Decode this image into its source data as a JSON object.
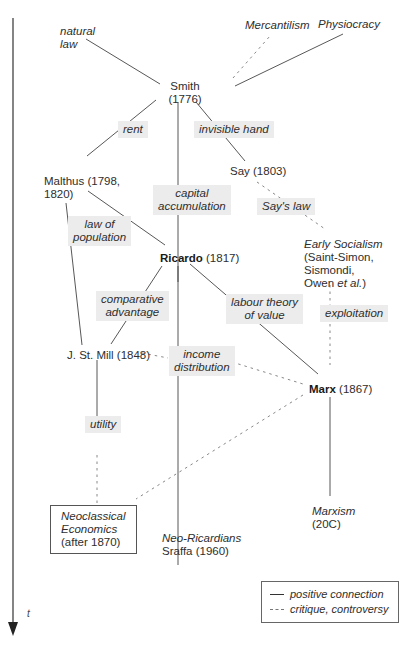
{
  "nodes": {
    "natural_law": {
      "line1": "natural",
      "line2": "law"
    },
    "mercantilism": "Mercantilism",
    "physiocracy": "Physiocracy",
    "smith": {
      "name": "Smith",
      "year": "(1776)"
    },
    "malthus": {
      "line1": "Malthus (1798,",
      "line2": "1820)"
    },
    "say": "Say (1803)",
    "ricardo": {
      "name": "Ricardo",
      "year": " (1817)"
    },
    "early_socialism": {
      "title": "Early Socialism",
      "line2": "(Saint-Simon,",
      "line3": "Sismondi,",
      "line4_pre": "Owen ",
      "line4_it": "et al.",
      "line4_post": ")"
    },
    "mill": "J. St. Mill (1848)",
    "marx": {
      "name": "Marx",
      "year": " (1867)"
    },
    "neoclassical": {
      "line1": "Neoclassical",
      "line2": "Economics",
      "line3": "(after 1870)"
    },
    "neo_ricardians": {
      "line1": "Neo-Ricardians",
      "line2": "Sraffa (1960)"
    },
    "marxism": {
      "line1": "Marxism",
      "line2": "(20C)"
    }
  },
  "edge_labels": {
    "rent": "rent",
    "invisible_hand": "invisible hand",
    "capital_accumulation": {
      "line1": "capital",
      "line2": "accumulation"
    },
    "says_law": "Say's law",
    "law_of_population": {
      "line1": "law of",
      "line2": "population"
    },
    "comparative_advantage": {
      "line1": "comparative",
      "line2": "advantage"
    },
    "labour_theory": {
      "line1": "labour theory",
      "line2": "of value"
    },
    "exploitation": "exploitation",
    "income_distribution": {
      "line1": "income",
      "line2": "distribution"
    },
    "utility": "utility"
  },
  "legend": {
    "solid": "positive connection",
    "dashed": "critique, controversy"
  },
  "axis": {
    "label": "t"
  },
  "colors": {
    "line": "#444444",
    "dashed": "#888888",
    "label_bg": "#ececec"
  }
}
